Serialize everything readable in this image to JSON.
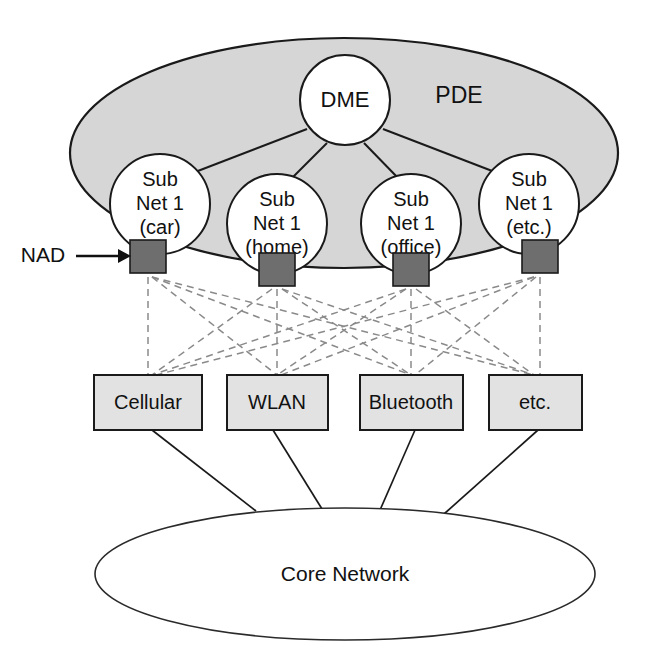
{
  "diagram": {
    "colors": {
      "pde_fill": "#d6d6d6",
      "node_fill": "#ffffff",
      "box_fill": "#e2e2e2",
      "nad_fill": "#6e6e6e",
      "outline": "#1a1a1a",
      "dashed_link": "#8a8a8a"
    },
    "pde": {
      "label": "PDE"
    },
    "dme": {
      "label": "DME"
    },
    "subnets": [
      {
        "line1": "Sub",
        "line2": "Net 1",
        "line3": "(car)"
      },
      {
        "line1": "Sub",
        "line2": "Net 1",
        "line3": "(home)"
      },
      {
        "line1": "Sub",
        "line2": "Net 1",
        "line3": "(office)"
      },
      {
        "line1": "Sub",
        "line2": "Net 1",
        "line3": "(etc.)"
      }
    ],
    "nad": {
      "label": "NAD",
      "count": 4
    },
    "access_networks": [
      {
        "label": "Cellular"
      },
      {
        "label": "WLAN"
      },
      {
        "label": "Bluetooth"
      },
      {
        "label": "etc."
      }
    ],
    "core": {
      "label": "Core Network"
    }
  }
}
